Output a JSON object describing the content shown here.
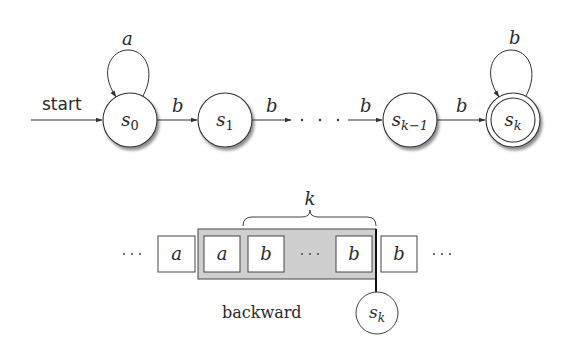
{
  "automaton": {
    "start_label": "start",
    "states": [
      {
        "id": "s0",
        "base": "s",
        "sub": "0",
        "cx": 130,
        "cy": 120,
        "accepting": false
      },
      {
        "id": "s1",
        "base": "s",
        "sub": "1",
        "cx": 225,
        "cy": 120,
        "accepting": false
      },
      {
        "id": "sk-1",
        "base": "s",
        "sub": "k−1",
        "cx": 410,
        "cy": 120,
        "accepting": false
      },
      {
        "id": "sk",
        "base": "s",
        "sub": "k",
        "cx": 513,
        "cy": 120,
        "accepting": true
      }
    ],
    "transitions": [
      {
        "from": "start",
        "to": "s0",
        "label": ""
      },
      {
        "from": "s0",
        "to": "s0",
        "label": "a"
      },
      {
        "from": "s0",
        "to": "s1",
        "label": "b"
      },
      {
        "from": "s1",
        "to": "…",
        "label": "b"
      },
      {
        "from": "…",
        "to": "sk-1",
        "label": "b"
      },
      {
        "from": "sk-1",
        "to": "sk",
        "label": "b"
      },
      {
        "from": "sk",
        "to": "sk",
        "label": "b"
      }
    ],
    "ellipsis": "· · · ·"
  },
  "tape": {
    "left_ellipsis": "· · ·",
    "right_ellipsis": "· · ·",
    "cells": [
      "a",
      "a",
      "b",
      "…",
      "b",
      "b"
    ],
    "window_label": "k",
    "window_caption": "backward",
    "head_state": {
      "base": "s",
      "sub": "k"
    }
  }
}
